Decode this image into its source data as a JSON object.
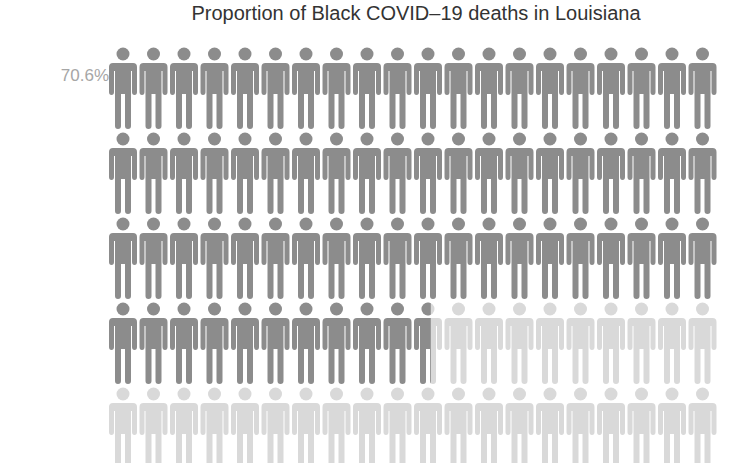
{
  "title": "Proportion of Black COVID–19 deaths in Louisiana",
  "label": "70.6%",
  "colors": {
    "filled": "#8c8c8c",
    "empty": "#d9d9d9",
    "title": "#333333",
    "label": "#a6a6a6"
  },
  "chart_data": {
    "type": "pictogram",
    "title": "Proportion of Black COVID–19 deaths in Louisiana",
    "value_percent": 70.6,
    "label": "70.6%",
    "total_icons": 100,
    "icons_per_row": 20,
    "rows": 5,
    "filled_icons": 70.6,
    "icon": "person-icon",
    "series": [
      {
        "name": "Black",
        "value": 70.6,
        "color": "#8c8c8c"
      },
      {
        "name": "Other",
        "value": 29.4,
        "color": "#d9d9d9"
      }
    ]
  }
}
